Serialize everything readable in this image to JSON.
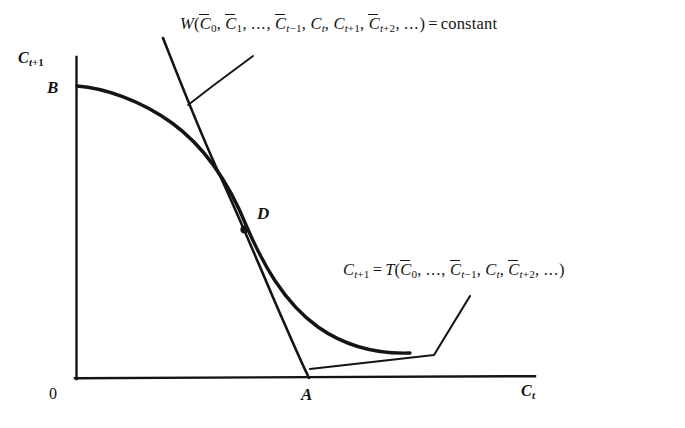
{
  "figure": {
    "type": "economics-diagram",
    "background_color": "#ffffff",
    "line_color": "#141414",
    "title": "",
    "axes": {
      "y_label": "C_t+1",
      "x_label": "C_t",
      "origin_label": "0",
      "x_axis_range_px": [
        76,
        535
      ],
      "y_axis_range_px": [
        57,
        378
      ]
    },
    "labels": {
      "welfare_curve": "W(C̄0, C̄1, ..., C̄t-1, Ct, Ct+1, C̄t+2, ...) = constant",
      "welfare_curve_parts": {
        "fn": "W",
        "open": "(",
        "args": [
          "C̄0",
          "C̄1",
          "...",
          "C̄t−1",
          "Ct",
          "Ct+1",
          "C̄t+2",
          "..."
        ],
        "close": ")",
        "relation": "=",
        "value": "constant"
      },
      "transformation_curve": "C_t+1 = T(C̄0, ..., C̄t-1, Ct, C̄t+2, ...)",
      "transformation_curve_parts": {
        "lhs": "Ct+1",
        "relation": "=",
        "fn": "T",
        "open": "(",
        "args": [
          "C̄0",
          "...",
          "C̄t−1",
          "Ct",
          "C̄t+2",
          "..."
        ],
        "close": ")"
      }
    },
    "points": {
      "B": {
        "label": "B",
        "x_px": 57,
        "y_px": 80,
        "on": "y-axis-intercept-of-T-curve"
      },
      "D": {
        "label": "D",
        "x_px": 259,
        "y_px": 206,
        "marker_x_px": 244,
        "marker_y_px": 230,
        "on": "tangency-of-W-and-T"
      },
      "A": {
        "label": "A",
        "x_px": 304,
        "y_px": 386,
        "on": "x-axis-intercept-of-W-curve"
      },
      "origin": {
        "label": "0",
        "x_px": 52,
        "y_px": 386
      }
    },
    "curves": [
      {
        "name": "welfare-indifference-curve",
        "style": "thin-solid",
        "from": "top",
        "through": "D",
        "to": "A"
      },
      {
        "name": "transformation-frontier",
        "style": "thick-solid",
        "from": "B",
        "through": "D",
        "to": "lower-right"
      }
    ],
    "leader_lines": [
      {
        "name": "welfare-label-leader",
        "from_px": [
          253,
          57
        ],
        "elbow_px": [
          214,
          85
        ],
        "to_px": [
          188,
          104
        ]
      },
      {
        "name": "transformation-label-leader",
        "from_px": [
          470,
          296
        ],
        "elbow_px": [
          434,
          355
        ],
        "to_px": [
          310,
          369
        ]
      }
    ]
  }
}
